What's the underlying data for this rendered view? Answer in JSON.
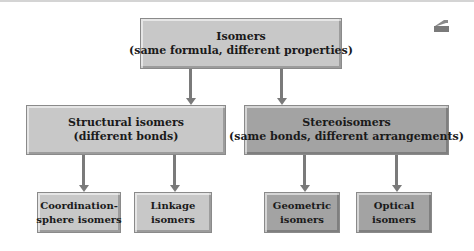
{
  "diagram": {
    "root": {
      "title": "Isomers",
      "subtitle": "(same formula, different properties)"
    },
    "level2": [
      {
        "title": "Structural isomers",
        "subtitle": "(different bonds)"
      },
      {
        "title": "Stereoisomers",
        "subtitle": "(same bonds, different arrangements)"
      }
    ],
    "level3": [
      {
        "line1": "Coordination-",
        "line2": "sphere isomers",
        "parent": "Structural isomers"
      },
      {
        "line1": "Linkage",
        "line2": "isomers",
        "parent": "Structural isomers"
      },
      {
        "line1": "Geometric",
        "line2": "isomers",
        "parent": "Stereoisomers"
      },
      {
        "line1": "Optical",
        "line2": "isomers",
        "parent": "Stereoisomers"
      }
    ]
  },
  "icons": {
    "corner": "home-icon"
  },
  "colors": {
    "light_box": "#c8c8c8",
    "dark_box": "#a3a3a3",
    "arrow": "#7a7a7a"
  }
}
